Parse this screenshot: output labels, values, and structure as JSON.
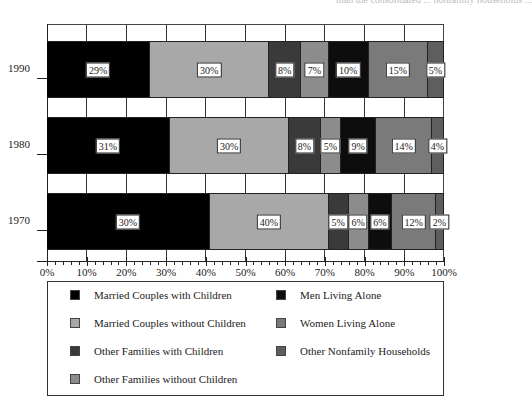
{
  "page": {
    "cut_text_top": "than the consolidated ... nonfamily households ..."
  },
  "colors": {
    "married_with_children": "#000000",
    "married_without_children": "#a8a8a8",
    "other_families_with_children": "#3a3a3a",
    "other_families_without_children": "#8c8c8c",
    "men_living_alone": "#0d0d0d",
    "women_living_alone": "#7a7a7a",
    "other_nonfamily": "#5e5e5e"
  },
  "chart_data": {
    "type": "bar",
    "orientation": "horizontal",
    "stacked": true,
    "title": "",
    "xlabel": "",
    "ylabel": "",
    "xlim": [
      0,
      100
    ],
    "x_ticks": [
      "0%",
      "10%",
      "20%",
      "30%",
      "40%",
      "50%",
      "60%",
      "70%",
      "80%",
      "90%",
      "100%"
    ],
    "grid": true,
    "legend_position": "bottom",
    "categories": [
      "1990",
      "1980",
      "1970"
    ],
    "series": [
      {
        "name": "Married Couples with Children",
        "values": [
          26,
          31,
          40
        ],
        "labels": [
          "29%",
          "31%",
          "30%"
        ]
      },
      {
        "name": "Married Couples without Children",
        "values": [
          30,
          30,
          30
        ],
        "labels": [
          "30%",
          "30%",
          "40%"
        ]
      },
      {
        "name": "Other Families with Children",
        "values": [
          8,
          8,
          5
        ],
        "labels": [
          "8%",
          "8%",
          "5%"
        ]
      },
      {
        "name": "Other Families without Children",
        "values": [
          7,
          5,
          6
        ],
        "labels": [
          "7%",
          "5%",
          "6%"
        ]
      },
      {
        "name": "Men Living Alone",
        "values": [
          10,
          9,
          6
        ],
        "labels": [
          "10%",
          "9%",
          "6%"
        ]
      },
      {
        "name": "Women Living Alone",
        "values": [
          15,
          14,
          12
        ],
        "labels": [
          "15%",
          "14%",
          "12%"
        ]
      },
      {
        "name": "Other Nonfamily Households",
        "values": [
          5,
          4,
          2
        ],
        "labels": [
          "5%",
          "4%",
          "2%"
        ]
      }
    ],
    "segment_widths_pct": {
      "1990": [
        26,
        30,
        8,
        7,
        10,
        15,
        4
      ],
      "1980": [
        31,
        30,
        8,
        5,
        9,
        14,
        3
      ],
      "1970": [
        41,
        30,
        5,
        5,
        6,
        11,
        2
      ]
    },
    "note": "Segment pixel widths differ from printed labels in the original figure (e.g. 1970 first segment spans ~41% but is labeled 30%; second labeled 40% spans ~30%)."
  },
  "legend": {
    "items": [
      {
        "label": "Married Couples with Children",
        "color_key": "married_with_children"
      },
      {
        "label": "Married Couples without Children",
        "color_key": "married_without_children"
      },
      {
        "label": "Other Families with Children",
        "color_key": "other_families_with_children"
      },
      {
        "label": "Other Families without Children",
        "color_key": "other_families_without_children"
      },
      {
        "label": "Men Living Alone",
        "color_key": "men_living_alone"
      },
      {
        "label": "Women Living Alone",
        "color_key": "women_living_alone"
      },
      {
        "label": "Other Nonfamily Households",
        "color_key": "other_nonfamily"
      }
    ]
  }
}
